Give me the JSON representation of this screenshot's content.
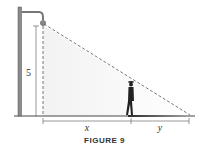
{
  "figure": {
    "caption": "FIGURE 9",
    "labels": {
      "height": "5",
      "x": "x",
      "y": "y"
    }
  },
  "colors": {
    "line": "#555555",
    "pole": "#7a7a7a",
    "shadow": "#2a2a2a",
    "ground": "#444444"
  }
}
